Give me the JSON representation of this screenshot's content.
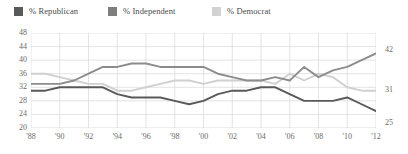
{
  "legend": {
    "items": [
      {
        "label": "% Republican",
        "color": "#595959",
        "swatch_name": "legend-swatch-republican",
        "x": 14
      },
      {
        "label": "% Independent",
        "color": "#7f7f7f",
        "swatch_name": "legend-swatch-independent",
        "x": 108
      },
      {
        "label": "% Democrat",
        "color": "#d2d2d2",
        "swatch_name": "legend-swatch-democrat",
        "x": 212
      }
    ]
  },
  "end_labels": [
    {
      "name": "end-label-independent",
      "text": "42",
      "x": 385,
      "y": 46,
      "series": "% Independent"
    },
    {
      "name": "end-label-democrat",
      "text": "31",
      "x": 385,
      "y": 86,
      "series": "% Democrat"
    },
    {
      "name": "end-label-republican",
      "text": "25",
      "x": 385,
      "y": 119,
      "series": "% Republican"
    }
  ],
  "chart_data": {
    "type": "line",
    "title": "",
    "subtitle": "",
    "xlabel": "",
    "ylabel": "",
    "xlim": [
      1988,
      2012
    ],
    "ylim": [
      20,
      48
    ],
    "ytick_step": 4,
    "grid": true,
    "grid_color": "#dcdcdc",
    "legend_position": "top-left",
    "yticks": [
      48,
      44,
      40,
      36,
      32,
      28,
      24,
      20
    ],
    "xticks": [
      "'88",
      "'90",
      "'92",
      "'94",
      "'96",
      "'98",
      "'00",
      "'02",
      "'04",
      "'06",
      "'08",
      "'10",
      "'12"
    ],
    "xtick_years": [
      1988,
      1990,
      1992,
      1994,
      1996,
      1998,
      2000,
      2002,
      2004,
      2006,
      2008,
      2010,
      2012
    ],
    "x": [
      1988,
      1989,
      1990,
      1991,
      1992,
      1993,
      1994,
      1995,
      1996,
      1997,
      1998,
      1999,
      2000,
      2001,
      2002,
      2003,
      2004,
      2005,
      2006,
      2007,
      2008,
      2009,
      2010,
      2011,
      2012
    ],
    "series": [
      {
        "name": "% Republican",
        "color": "#595959",
        "values": [
          31,
          31,
          32,
          32,
          32,
          32,
          30,
          29,
          29,
          29,
          28,
          27,
          28,
          30,
          31,
          31,
          32,
          32,
          30,
          28,
          28,
          28,
          29,
          27,
          25
        ]
      },
      {
        "name": "% Independent",
        "color": "#8c8c8c",
        "values": [
          33,
          33,
          33,
          34,
          36,
          38,
          38,
          39,
          39,
          38,
          38,
          38,
          38,
          36,
          35,
          34,
          34,
          35,
          34,
          38,
          35,
          37,
          38,
          40,
          42
        ]
      },
      {
        "name": "% Democrat",
        "color": "#d0d0d0",
        "values": [
          36,
          36,
          35,
          34,
          33,
          33,
          31,
          31,
          32,
          33,
          34,
          34,
          33,
          34,
          34,
          34,
          34,
          33,
          36,
          34,
          36,
          35,
          32,
          31,
          31
        ]
      }
    ]
  }
}
